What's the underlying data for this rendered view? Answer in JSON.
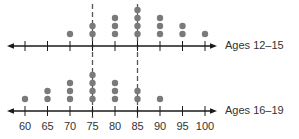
{
  "chart_data": {
    "type": "scatter",
    "subtype": "dot_plot",
    "title": "",
    "xlabel": "",
    "ylabel": "",
    "x_ticks": [
      60,
      65,
      70,
      75,
      80,
      85,
      90,
      95,
      100
    ],
    "xlim": [
      60,
      100
    ],
    "grid": false,
    "reference_lines": [
      75,
      85
    ],
    "series": [
      {
        "name": "Ages 12–15",
        "values": {
          "60": 0,
          "65": 0,
          "70": 1,
          "75": 2,
          "80": 3,
          "85": 4,
          "90": 3,
          "95": 2,
          "100": 1
        }
      },
      {
        "name": "Ages 16–19",
        "values": {
          "60": 1,
          "65": 2,
          "70": 3,
          "75": 4,
          "80": 3,
          "85": 2,
          "90": 1,
          "95": 0,
          "100": 0
        }
      }
    ]
  },
  "labels": {
    "top_series": "Ages 12–15",
    "bottom_series": "Ages 16–19",
    "ticks": [
      "60",
      "65",
      "70",
      "75",
      "80",
      "85",
      "90",
      "95",
      "100"
    ]
  },
  "colors": {
    "dot": "#7a7a7a",
    "axis": "#1a1a1a",
    "dash": "#555555"
  }
}
